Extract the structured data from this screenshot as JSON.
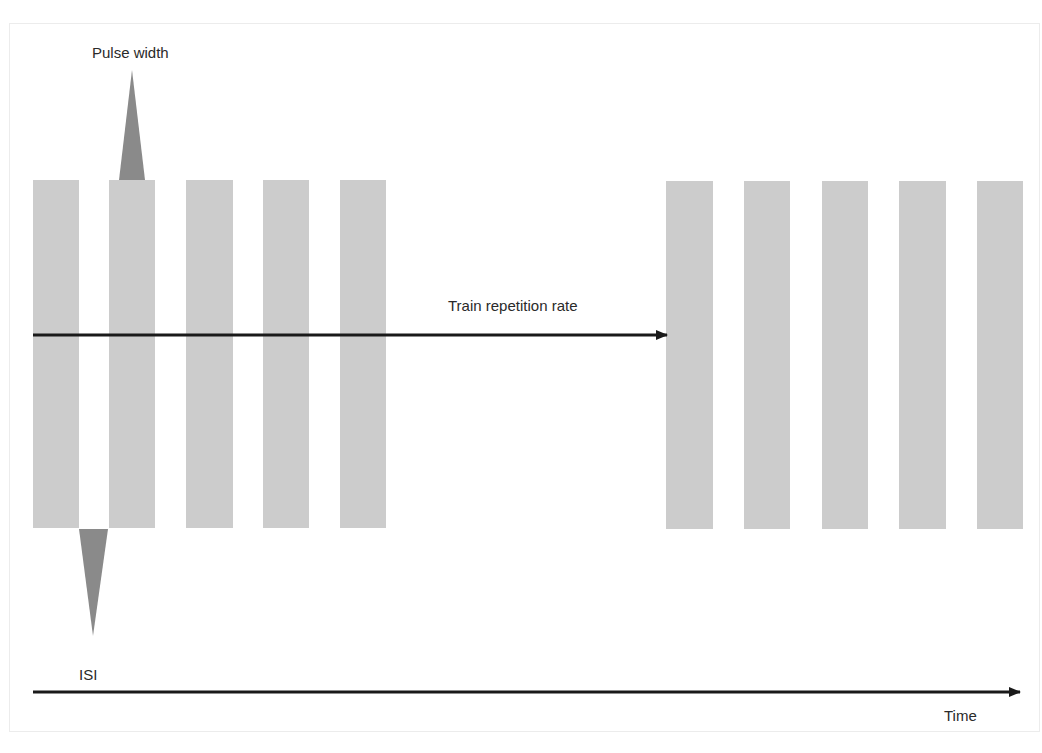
{
  "diagram": {
    "title": "",
    "labels": {
      "pulse_width": "Pulse width",
      "train_repetition_rate": "Train repetition rate",
      "isi": "ISI",
      "time": "Time"
    },
    "colors": {
      "pulse_bar": "#cccccc",
      "marker_triangle": "#8a8a8a",
      "arrow": "#1a1a1a",
      "frame": "#ececec"
    },
    "trains": [
      {
        "name": "train-1",
        "pulse_count": 5,
        "bars_x": [
          [
            33,
            79
          ],
          [
            109,
            155
          ],
          [
            186,
            233
          ],
          [
            263,
            309
          ],
          [
            340,
            386
          ]
        ],
        "top": 180,
        "bottom": 528
      },
      {
        "name": "train-2",
        "pulse_count": 5,
        "bars_x": [
          [
            666,
            713
          ],
          [
            744,
            790
          ],
          [
            822,
            868
          ],
          [
            899,
            946
          ],
          [
            977,
            1023
          ]
        ],
        "top": 181,
        "bottom": 529
      }
    ],
    "arrows": [
      {
        "name": "train-repetition-rate-arrow",
        "from": [
          33,
          335
        ],
        "to": [
          667,
          335
        ]
      },
      {
        "name": "time-axis-arrow",
        "from": [
          33,
          692
        ],
        "to": [
          1020,
          692
        ]
      }
    ],
    "markers": [
      {
        "name": "pulse-width-marker",
        "direction": "up",
        "base": [
          119,
          145
        ],
        "base_y": 180,
        "tip": [
          132,
          70
        ]
      },
      {
        "name": "isi-marker",
        "direction": "down",
        "base": [
          79,
          108
        ],
        "base_y": 529,
        "tip": [
          93,
          636
        ]
      }
    ]
  }
}
